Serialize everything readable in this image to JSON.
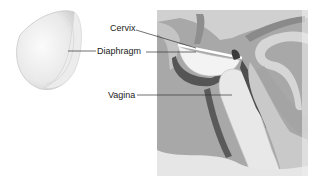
{
  "figure": {
    "labels": {
      "cervix": "Cervix",
      "diaphragm": "Diaphragm",
      "vagina": "Vagina"
    },
    "colors": {
      "panel_bg": "#a8a8a8",
      "tissue_light": "#d2d2d2",
      "tissue_mid": "#9a9a9a",
      "tissue_dark": "#5a5a5a",
      "device": "#f2f2f2",
      "leader_line": "#333333"
    }
  }
}
